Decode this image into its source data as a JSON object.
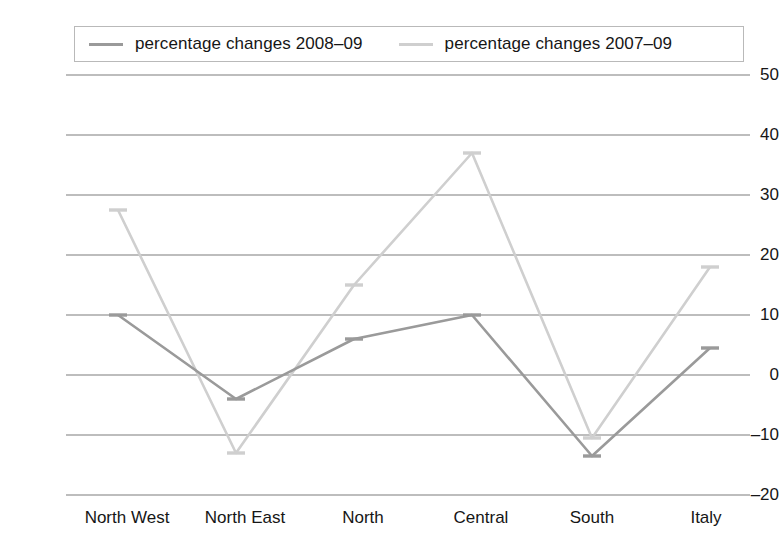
{
  "legend": {
    "position": "top",
    "entries": [
      {
        "label": "percentage changes 2008–09",
        "color": "#9a9a9a"
      },
      {
        "label": "percentage changes 2007–09",
        "color": "#cfcfcf"
      }
    ]
  },
  "axes": {
    "y_ticks": [
      "50",
      "40",
      "30",
      "20",
      "10",
      "0",
      "–10",
      "–20"
    ],
    "x_ticks": [
      "North West",
      "North East",
      "North",
      "Central",
      "South",
      "Italy"
    ]
  },
  "chart_data": {
    "type": "line",
    "title": "",
    "subtitle": "",
    "xlabel": "",
    "ylabel": "",
    "categories": [
      "North West",
      "North East",
      "North",
      "Central",
      "South",
      "Italy"
    ],
    "series": [
      {
        "name": "percentage changes 2008–09",
        "color": "#9a9a9a",
        "values": [
          10,
          -4,
          6,
          10,
          -13.5,
          4.5
        ]
      },
      {
        "name": "percentage changes 2007–09",
        "color": "#cfcfcf",
        "values": [
          27.5,
          -13,
          15,
          37,
          -10.5,
          18
        ]
      }
    ],
    "ylim": [
      -20,
      50
    ],
    "ytick_step": 10,
    "grid": true,
    "grid_axis": "y",
    "legend_position": "top",
    "markers": "dash"
  },
  "colors": {
    "series_dark": "#9a9a9a",
    "series_light": "#cfcfcf",
    "gridline": "#7d7d7d",
    "text": "#161616",
    "background": "#ffffff"
  }
}
